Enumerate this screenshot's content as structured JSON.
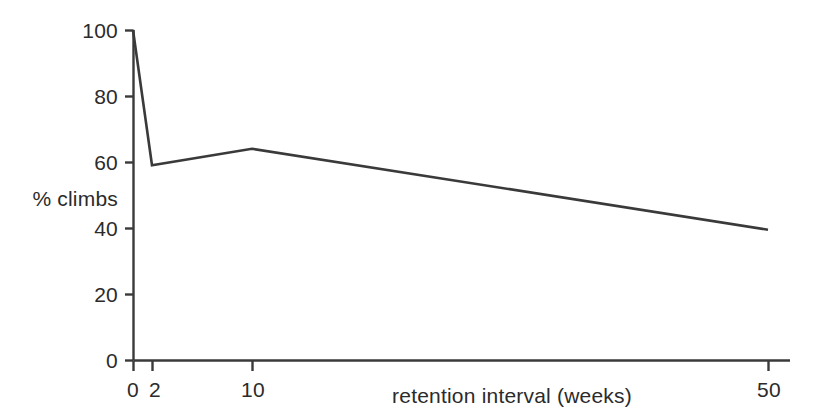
{
  "chart_data": {
    "type": "line",
    "title": "",
    "subtitle": "",
    "xlabel": "retention interval (weeks)",
    "ylabel": "% climbs",
    "x": [
      0,
      2,
      10,
      50
    ],
    "values": [
      100,
      59,
      64,
      39.5
    ],
    "series": [
      {
        "name": "% climbs",
        "x": [
          0,
          2,
          10,
          50
        ],
        "values": [
          100,
          59,
          64,
          39.5
        ]
      }
    ],
    "xticks": [
      0,
      2,
      10,
      50
    ],
    "xtick_labels": [
      "0",
      "2",
      "10",
      "50"
    ],
    "yticks": [
      0,
      20,
      40,
      60,
      80,
      100
    ],
    "ytick_labels": [
      "0",
      "20",
      "40",
      "60",
      "80",
      "100"
    ],
    "xlim": [
      0,
      50
    ],
    "ylim": [
      0,
      100
    ],
    "x_scale": "non-linear (categorical spacing: 0, 2, 10, 50)",
    "grid": false,
    "legend": null,
    "annotations": [],
    "line_color": "#3a3a3a",
    "background_color": "#ffffff",
    "axis_color": "#3a3a3a"
  },
  "geometry": {
    "note": "pixel anchors measured from the source scan",
    "x_pixels": [
      133,
      152,
      252,
      768
    ],
    "y_zero_px": 360,
    "y_hundred_px": 30
  }
}
